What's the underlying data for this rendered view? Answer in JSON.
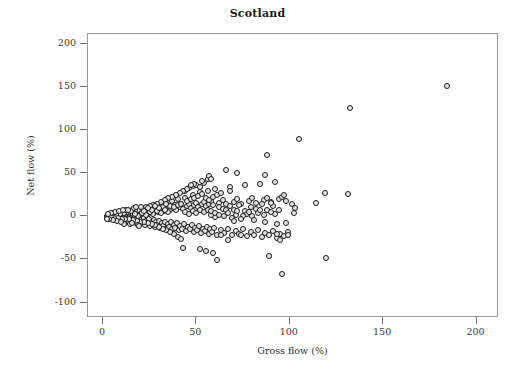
{
  "chart_data": {
    "type": "scatter",
    "title": "Scotland",
    "xlabel": "Gross flow (%)",
    "ylabel": "Net flow (%)",
    "xlim": [
      -8,
      212
    ],
    "ylim": [
      -118,
      212
    ],
    "xticks": [
      0,
      50,
      100,
      150,
      200
    ],
    "xticklabels": [
      "0",
      "50",
      "100",
      "150",
      "200"
    ],
    "yticks": [
      200,
      150,
      100,
      50,
      0,
      -50,
      -100
    ],
    "yticklabels": [
      "200",
      "150",
      "100",
      "50",
      "0",
      "-50",
      "-100"
    ],
    "grid": false,
    "legend": null,
    "marker": {
      "shape": "circle",
      "edge_color": "#1c1c1c",
      "face_color": "#e3e3e3",
      "size_px": 6
    },
    "frame_color": "#9a9a9a",
    "background": "#ffffff",
    "n_points": 520,
    "points": [
      [
        2.0,
        -1.0
      ],
      [
        2.3,
        0.5
      ],
      [
        2.6,
        -2.0
      ],
      [
        2.8,
        1.5
      ],
      [
        3.0,
        -0.5
      ],
      [
        3.1,
        2.0
      ],
      [
        3.3,
        -1.5
      ],
      [
        3.5,
        0.0
      ],
      [
        3.6,
        1.0
      ],
      [
        3.8,
        -2.5
      ],
      [
        4.0,
        2.5
      ],
      [
        4.1,
        -1.0
      ],
      [
        4.3,
        0.5
      ],
      [
        4.5,
        3.0
      ],
      [
        4.6,
        -3.0
      ],
      [
        4.8,
        1.5
      ],
      [
        5.0,
        -2.0
      ],
      [
        5.1,
        0.0
      ],
      [
        5.3,
        2.0
      ],
      [
        5.5,
        -1.5
      ],
      [
        5.6,
        3.5
      ],
      [
        5.8,
        -3.5
      ],
      [
        6.0,
        1.0
      ],
      [
        6.2,
        -0.5
      ],
      [
        6.4,
        2.5
      ],
      [
        6.6,
        -2.5
      ],
      [
        6.8,
        0.5
      ],
      [
        7.0,
        4.0
      ],
      [
        7.2,
        -4.0
      ],
      [
        7.4,
        1.5
      ],
      [
        7.6,
        -1.0
      ],
      [
        7.8,
        3.0
      ],
      [
        8.0,
        -3.0
      ],
      [
        8.2,
        0.0
      ],
      [
        8.4,
        2.0
      ],
      [
        8.6,
        -2.0
      ],
      [
        8.8,
        4.5
      ],
      [
        9.0,
        -4.5
      ],
      [
        9.2,
        1.0
      ],
      [
        9.4,
        -0.5
      ],
      [
        9.6,
        3.5
      ],
      [
        9.8,
        -3.5
      ],
      [
        10.0,
        2.5
      ],
      [
        10.3,
        -2.5
      ],
      [
        10.5,
        5.0
      ],
      [
        10.7,
        -5.0
      ],
      [
        11.0,
        1.5
      ],
      [
        11.2,
        -1.5
      ],
      [
        11.5,
        4.0
      ],
      [
        11.7,
        -4.0
      ],
      [
        12.0,
        0.5
      ],
      [
        12.2,
        3.0
      ],
      [
        12.5,
        -3.0
      ],
      [
        12.7,
        5.5
      ],
      [
        13.0,
        -5.5
      ],
      [
        13.2,
        2.0
      ],
      [
        13.5,
        -2.0
      ],
      [
        13.7,
        6.0
      ],
      [
        14.0,
        -6.0
      ],
      [
        14.3,
        1.0
      ],
      [
        14.5,
        4.5
      ],
      [
        14.8,
        -4.5
      ],
      [
        15.0,
        3.5
      ],
      [
        15.3,
        -3.5
      ],
      [
        15.5,
        7.0
      ],
      [
        15.8,
        -7.0
      ],
      [
        16.0,
        2.5
      ],
      [
        16.3,
        -2.5
      ],
      [
        16.5,
        5.0
      ],
      [
        16.8,
        -5.0
      ],
      [
        17.0,
        0.5
      ],
      [
        17.3,
        8.0
      ],
      [
        17.5,
        -8.0
      ],
      [
        17.8,
        3.0
      ],
      [
        18.0,
        -3.0
      ],
      [
        18.3,
        6.0
      ],
      [
        18.6,
        -6.0
      ],
      [
        19.0,
        1.5
      ],
      [
        19.3,
        -1.5
      ],
      [
        19.6,
        9.0
      ],
      [
        20.0,
        -9.0
      ],
      [
        20.3,
        4.0
      ],
      [
        20.6,
        -4.0
      ],
      [
        21.0,
        7.0
      ],
      [
        21.3,
        -7.0
      ],
      [
        21.6,
        2.0
      ],
      [
        22.0,
        -2.0
      ],
      [
        22.3,
        10.0
      ],
      [
        22.6,
        -10.0
      ],
      [
        23.0,
        5.0
      ],
      [
        23.3,
        -5.0
      ],
      [
        23.6,
        8.0
      ],
      [
        24.0,
        -8.0
      ],
      [
        24.3,
        3.0
      ],
      [
        24.6,
        -3.0
      ],
      [
        25.0,
        11.0
      ],
      [
        25.3,
        -11.0
      ],
      [
        25.6,
        6.0
      ],
      [
        26.0,
        -6.0
      ],
      [
        26.3,
        9.0
      ],
      [
        26.6,
        -9.0
      ],
      [
        27.0,
        4.0
      ],
      [
        27.3,
        -4.0
      ],
      [
        27.6,
        12.0
      ],
      [
        28.0,
        -12.0
      ],
      [
        28.3,
        7.0
      ],
      [
        28.6,
        -7.0
      ],
      [
        29.0,
        10.0
      ],
      [
        29.3,
        -10.0
      ],
      [
        29.6,
        5.0
      ],
      [
        30.0,
        -5.0
      ],
      [
        30.4,
        14.0
      ],
      [
        30.8,
        -13.0
      ],
      [
        31.2,
        8.0
      ],
      [
        31.6,
        -8.0
      ],
      [
        32.0,
        11.0
      ],
      [
        32.4,
        -11.0
      ],
      [
        32.8,
        6.0
      ],
      [
        33.2,
        -6.0
      ],
      [
        33.6,
        16.0
      ],
      [
        34.0,
        -14.0
      ],
      [
        34.4,
        9.0
      ],
      [
        34.8,
        -9.0
      ],
      [
        35.2,
        12.0
      ],
      [
        35.6,
        -12.0
      ],
      [
        36.0,
        7.0
      ],
      [
        36.4,
        -7.0
      ],
      [
        36.8,
        18.0
      ],
      [
        37.2,
        -15.0
      ],
      [
        37.6,
        10.0
      ],
      [
        38.0,
        -10.0
      ],
      [
        38.4,
        13.0
      ],
      [
        38.8,
        -13.0
      ],
      [
        39.2,
        8.0
      ],
      [
        39.6,
        -8.0
      ],
      [
        40.0,
        20.0
      ],
      [
        40.5,
        -16.0
      ],
      [
        41.0,
        11.0
      ],
      [
        41.5,
        -11.0
      ],
      [
        42.0,
        14.0
      ],
      [
        42.5,
        -14.0
      ],
      [
        43.0,
        9.0
      ],
      [
        43.5,
        -9.0
      ],
      [
        44.0,
        22.0
      ],
      [
        44.5,
        -17.0
      ],
      [
        45.0,
        12.0
      ],
      [
        45.5,
        -12.0
      ],
      [
        46.0,
        15.0
      ],
      [
        46.5,
        -15.0
      ],
      [
        47.0,
        10.0
      ],
      [
        47.5,
        -10.0
      ],
      [
        48.0,
        25.0
      ],
      [
        48.5,
        -18.0
      ],
      [
        49.0,
        13.0
      ],
      [
        49.5,
        -13.0
      ],
      [
        50.0,
        16.0
      ],
      [
        50.5,
        -16.0
      ],
      [
        51.0,
        11.0
      ],
      [
        51.5,
        -11.0
      ],
      [
        52.0,
        28.0
      ],
      [
        52.5,
        -19.0
      ],
      [
        53.0,
        14.0
      ],
      [
        53.5,
        -14.0
      ],
      [
        54.0,
        17.0
      ],
      [
        54.5,
        -17.0
      ],
      [
        55.0,
        12.0
      ],
      [
        55.5,
        -12.0
      ],
      [
        56.0,
        30.0
      ],
      [
        56.5,
        -20.0
      ],
      [
        57.0,
        15.0
      ],
      [
        57.5,
        -15.0
      ],
      [
        58.0,
        18.0
      ],
      [
        58.5,
        -18.0
      ],
      [
        59.0,
        13.0
      ],
      [
        59.5,
        -13.0
      ],
      [
        60.0,
        32.0
      ],
      [
        61.0,
        -21.0
      ],
      [
        62.0,
        16.0
      ],
      [
        63.0,
        -16.0
      ],
      [
        64.0,
        19.0
      ],
      [
        65.0,
        -19.0
      ],
      [
        66.0,
        14.0
      ],
      [
        67.0,
        -14.0
      ],
      [
        68.0,
        34.0
      ],
      [
        69.0,
        -22.0
      ],
      [
        70.0,
        17.0
      ],
      [
        71.0,
        -17.0
      ],
      [
        72.0,
        20.0
      ],
      [
        73.0,
        -20.0
      ],
      [
        74.0,
        15.0
      ],
      [
        75.0,
        -15.0
      ],
      [
        76.0,
        36.0
      ],
      [
        77.0,
        -23.0
      ],
      [
        78.0,
        18.0
      ],
      [
        79.0,
        -18.0
      ],
      [
        80.0,
        21.0
      ],
      [
        81.0,
        -21.0
      ],
      [
        82.0,
        16.0
      ],
      [
        83.0,
        -16.0
      ],
      [
        84.0,
        38.0
      ],
      [
        85.0,
        -24.0
      ],
      [
        86.0,
        19.0
      ],
      [
        87.0,
        -19.0
      ],
      [
        88.0,
        22.0
      ],
      [
        89.0,
        -22.0
      ],
      [
        90.0,
        17.0
      ],
      [
        91.0,
        -17.0
      ],
      [
        92.0,
        40.0
      ],
      [
        93.0,
        -25.0
      ],
      [
        94.0,
        20.0
      ],
      [
        95.0,
        -20.0
      ],
      [
        96.0,
        23.0
      ],
      [
        97.0,
        -23.0
      ],
      [
        98.0,
        18.0
      ],
      [
        99.0,
        -18.0
      ],
      [
        43.0,
        -37.0
      ],
      [
        52.0,
        -38.0
      ],
      [
        55.0,
        -40.0
      ],
      [
        59.0,
        -43.0
      ],
      [
        61.0,
        -51.0
      ],
      [
        66.0,
        54.0
      ],
      [
        68.0,
        29.0
      ],
      [
        72.0,
        50.0
      ],
      [
        74.0,
        -21.0
      ],
      [
        67.0,
        -27.0
      ],
      [
        63.0,
        -22.0
      ],
      [
        87.0,
        48.0
      ],
      [
        88.0,
        71.0
      ],
      [
        89.0,
        -46.0
      ],
      [
        93.0,
        -20.0
      ],
      [
        95.0,
        -27.0
      ],
      [
        96.0,
        -67.0
      ],
      [
        97.0,
        25.0
      ],
      [
        98.0,
        -8.0
      ],
      [
        99.0,
        -21.0
      ],
      [
        101.0,
        14.0
      ],
      [
        102.0,
        4.0
      ],
      [
        103.0,
        10.0
      ],
      [
        105.0,
        90.0
      ],
      [
        114.0,
        16.0
      ],
      [
        119.0,
        27.0
      ],
      [
        119.5,
        -48.0
      ],
      [
        131.0,
        26.0
      ],
      [
        132.0,
        126.0
      ],
      [
        184.0,
        152.0
      ],
      [
        44.0,
        30.0
      ],
      [
        46.0,
        33.0
      ],
      [
        48.0,
        35.0
      ],
      [
        50.0,
        37.0
      ],
      [
        52.0,
        34.0
      ],
      [
        54.0,
        39.0
      ],
      [
        56.0,
        44.0
      ],
      [
        57.0,
        47.0
      ],
      [
        58.0,
        43.0
      ],
      [
        53.0,
        41.0
      ],
      [
        49.0,
        38.0
      ],
      [
        47.0,
        36.0
      ],
      [
        45.0,
        32.0
      ],
      [
        43.0,
        29.0
      ],
      [
        41.0,
        27.0
      ],
      [
        39.0,
        25.0
      ],
      [
        37.0,
        23.0
      ],
      [
        35.0,
        21.0
      ],
      [
        33.0,
        19.0
      ],
      [
        31.0,
        17.0
      ],
      [
        29.0,
        15.0
      ],
      [
        27.0,
        13.0
      ],
      [
        25.0,
        12.0
      ],
      [
        23.0,
        11.0
      ],
      [
        21.0,
        9.0
      ],
      [
        19.0,
        8.0
      ],
      [
        17.0,
        7.0
      ],
      [
        15.0,
        6.0
      ],
      [
        13.0,
        5.0
      ],
      [
        11.0,
        4.0
      ],
      [
        9.0,
        3.0
      ],
      [
        7.0,
        2.0
      ],
      [
        5.0,
        1.5
      ],
      [
        4.0,
        1.0
      ],
      [
        3.0,
        0.5
      ],
      [
        62.0,
        11.0
      ],
      [
        64.0,
        9.0
      ],
      [
        66.0,
        7.0
      ],
      [
        68.0,
        12.0
      ],
      [
        70.0,
        8.0
      ],
      [
        73.0,
        13.0
      ],
      [
        76.0,
        6.0
      ],
      [
        79.0,
        11.0
      ],
      [
        82.0,
        9.0
      ],
      [
        85.0,
        14.0
      ],
      [
        88.0,
        8.0
      ],
      [
        91.0,
        12.0
      ],
      [
        94.0,
        7.0
      ],
      [
        90.0,
        16.0
      ],
      [
        92.0,
        3.0
      ],
      [
        86.0,
        2.0
      ],
      [
        83.0,
        4.0
      ],
      [
        80.0,
        1.0
      ],
      [
        77.0,
        3.0
      ],
      [
        75.0,
        0.0
      ],
      [
        71.0,
        2.0
      ],
      [
        69.0,
        -2.0
      ],
      [
        65.0,
        1.0
      ],
      [
        60.0,
        -1.0
      ],
      [
        58.0,
        2.0
      ],
      [
        40.0,
        -24.0
      ],
      [
        42.0,
        -26.0
      ],
      [
        38.0,
        -20.0
      ],
      [
        36.0,
        -18.0
      ],
      [
        34.0,
        -16.0
      ],
      [
        32.0,
        -14.0
      ],
      [
        30.0,
        -12.0
      ],
      [
        28.0,
        -10.0
      ],
      [
        26.0,
        -9.0
      ],
      [
        24.0,
        -8.0
      ],
      [
        22.0,
        -7.0
      ],
      [
        20.0,
        -6.0
      ],
      [
        18.0,
        -5.0
      ],
      [
        16.0,
        -4.0
      ],
      [
        14.0,
        -3.5
      ],
      [
        12.0,
        -3.0
      ],
      [
        10.0,
        -2.5
      ],
      [
        8.0,
        -2.0
      ],
      [
        6.0,
        -1.5
      ],
      [
        4.5,
        -1.0
      ],
      [
        45.0,
        18.0
      ],
      [
        47.0,
        20.0
      ],
      [
        49.0,
        22.0
      ],
      [
        51.0,
        24.0
      ],
      [
        53.0,
        26.0
      ],
      [
        55.0,
        21.0
      ],
      [
        57.0,
        19.0
      ],
      [
        59.0,
        23.0
      ],
      [
        61.0,
        25.0
      ],
      [
        63.0,
        27.0
      ],
      [
        44.0,
        5.0
      ],
      [
        46.0,
        3.0
      ],
      [
        48.0,
        6.0
      ],
      [
        50.0,
        4.0
      ],
      [
        52.0,
        7.0
      ],
      [
        54.0,
        5.0
      ],
      [
        56.0,
        8.0
      ],
      [
        58.0,
        6.0
      ],
      [
        60.0,
        4.0
      ],
      [
        62.0,
        2.0
      ],
      [
        35.0,
        5.0
      ],
      [
        33.0,
        7.0
      ],
      [
        31.0,
        4.0
      ],
      [
        29.0,
        6.0
      ],
      [
        27.0,
        3.0
      ],
      [
        25.0,
        5.0
      ],
      [
        23.0,
        2.0
      ],
      [
        21.0,
        4.0
      ],
      [
        19.0,
        1.0
      ],
      [
        17.0,
        3.0
      ],
      [
        36.0,
        12.0
      ],
      [
        34.0,
        14.0
      ],
      [
        38.0,
        11.0
      ],
      [
        40.0,
        13.0
      ],
      [
        42.0,
        15.0
      ],
      [
        30.0,
        10.0
      ],
      [
        28.0,
        12.0
      ],
      [
        26.0,
        8.0
      ],
      [
        24.0,
        10.0
      ],
      [
        22.0,
        6.0
      ],
      [
        67.0,
        4.0
      ],
      [
        70.0,
        -5.0
      ],
      [
        72.0,
        6.0
      ],
      [
        74.0,
        -3.0
      ],
      [
        78.0,
        5.0
      ],
      [
        81.0,
        -4.0
      ],
      [
        84.0,
        7.0
      ],
      [
        87.0,
        -6.0
      ],
      [
        90.0,
        5.0
      ],
      [
        93.0,
        -9.0
      ],
      [
        12.5,
        8.0
      ],
      [
        14.5,
        -9.0
      ],
      [
        16.5,
        9.5
      ],
      [
        18.5,
        -10.5
      ],
      [
        20.5,
        11.0
      ],
      [
        11.5,
        -8.5
      ],
      [
        13.5,
        7.5
      ],
      [
        15.5,
        -7.5
      ],
      [
        17.5,
        10.5
      ],
      [
        19.5,
        -11.5
      ],
      [
        6.5,
        5.5
      ],
      [
        7.5,
        -5.5
      ],
      [
        8.5,
        6.5
      ],
      [
        9.5,
        -6.5
      ],
      [
        10.5,
        7.0
      ],
      [
        5.5,
        -4.5
      ],
      [
        4.2,
        4.2
      ],
      [
        3.4,
        -3.4
      ],
      [
        2.9,
        3.1
      ],
      [
        2.4,
        -2.6
      ]
    ]
  }
}
